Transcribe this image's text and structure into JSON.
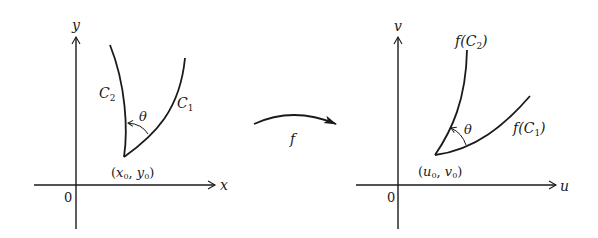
{
  "diagram": {
    "left_panel": {
      "x_axis_label": "x",
      "y_axis_label": "y",
      "origin_label": "0",
      "point_label_open": "(",
      "point_x": "x",
      "point_x_sub": "0",
      "point_sep": ", ",
      "point_y": "y",
      "point_y_sub": "0",
      "point_label_close": ")",
      "curve1_label": "C",
      "curve1_sub": "1",
      "curve2_label": "C",
      "curve2_sub": "2",
      "angle_label": "θ"
    },
    "mapping": {
      "label": "f"
    },
    "right_panel": {
      "x_axis_label": "u",
      "y_axis_label": "v",
      "origin_label": "0",
      "point_label_open": "(",
      "point_x": "u",
      "point_x_sub": "0",
      "point_sep": ", ",
      "point_y": "v",
      "point_y_sub": "0",
      "point_label_close": ")",
      "curve1_label_prefix": "f(",
      "curve1_label": "C",
      "curve1_sub": "1",
      "curve1_label_suffix": ")",
      "curve2_label_prefix": "f(",
      "curve2_label": "C",
      "curve2_sub": "2",
      "curve2_label_suffix": ")",
      "angle_label": "θ"
    },
    "colors": {
      "ink": "#1a1a1a",
      "background": "#ffffff"
    }
  }
}
